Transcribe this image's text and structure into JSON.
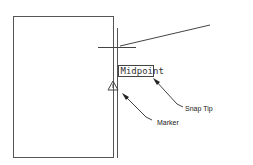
{
  "diagram": {
    "snap_tip_text": "Midpoint",
    "labels": {
      "snap_tip": "Snap Tip",
      "marker": "Marker"
    },
    "colors": {
      "line": "#444444",
      "background": "#ffffff"
    }
  }
}
